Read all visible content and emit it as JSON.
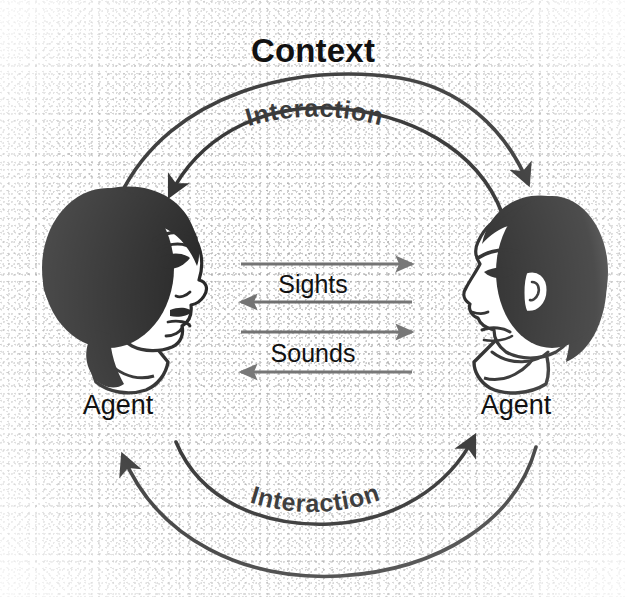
{
  "diagram": {
    "title": "Context",
    "background_color": "#ffffff",
    "ink_color": "#111111",
    "arrow_color": "#6b6b6b",
    "nodes": [
      {
        "id": "agent-left",
        "label": "Agent",
        "icon": "face-profile-female-icon",
        "facing": "right"
      },
      {
        "id": "agent-right",
        "label": "Agent",
        "icon": "face-profile-male-icon",
        "facing": "left"
      }
    ],
    "channels": [
      {
        "label": "Sights",
        "directions": [
          "right",
          "left"
        ]
      },
      {
        "label": "Sounds",
        "directions": [
          "right",
          "left"
        ]
      }
    ],
    "loops": [
      {
        "id": "interaction-top",
        "label": "Interaction",
        "position": "top",
        "direction": "both"
      },
      {
        "id": "interaction-bottom",
        "label": "Interaction",
        "position": "bottom",
        "direction": "both"
      }
    ]
  }
}
